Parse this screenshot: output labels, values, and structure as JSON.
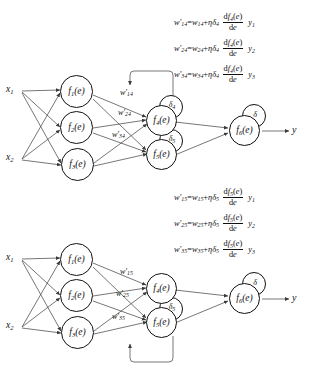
{
  "figure": {
    "type": "neural-network-backpropagation-diagram",
    "panels": [
      {
        "id": "top",
        "inputs": [
          {
            "name": "x1",
            "base": "x",
            "sub": "1"
          },
          {
            "name": "x2",
            "base": "x",
            "sub": "2"
          }
        ],
        "hidden_layer": [
          {
            "name": "f1",
            "base": "f",
            "sub": "1",
            "arg": "(e)"
          },
          {
            "name": "f2",
            "base": "f",
            "sub": "2",
            "arg": "(e)"
          },
          {
            "name": "f3",
            "base": "f",
            "sub": "3",
            "arg": "(e)"
          }
        ],
        "second_layer": [
          {
            "name": "f4",
            "base": "f",
            "sub": "4",
            "arg": "(e)",
            "delta": "4",
            "has_delta": true
          },
          {
            "name": "f5",
            "base": "f",
            "sub": "5",
            "arg": "(e)",
            "delta": "5",
            "has_delta": true
          }
        ],
        "output_layer": [
          {
            "name": "f6",
            "base": "f",
            "sub": "6",
            "arg": "(e)",
            "delta": "",
            "has_delta": true
          }
        ],
        "output_label": "y",
        "weight_labels": [
          {
            "base": "w",
            "prime": true,
            "sub": "14"
          },
          {
            "base": "w",
            "prime": true,
            "sub": "24"
          },
          {
            "base": "w",
            "prime": true,
            "sub": "34"
          }
        ],
        "formulas": [
          {
            "lhs_sub": "14",
            "rhs_sub": "14",
            "delta_sub": "4",
            "func_sub": "4",
            "y_sub": "1"
          },
          {
            "lhs_sub": "24",
            "rhs_sub": "24",
            "delta_sub": "4",
            "func_sub": "4",
            "y_sub": "2"
          },
          {
            "lhs_sub": "34",
            "rhs_sub": "34",
            "delta_sub": "4",
            "func_sub": "4",
            "y_sub": "3"
          }
        ],
        "feedback_loop": "from-f4-delta-back-to-hidden-layer-weights"
      },
      {
        "id": "bottom",
        "inputs": [
          {
            "name": "x1",
            "base": "x",
            "sub": "1"
          },
          {
            "name": "x2",
            "base": "x",
            "sub": "2"
          }
        ],
        "hidden_layer": [
          {
            "name": "f1",
            "base": "f",
            "sub": "1",
            "arg": "(e)"
          },
          {
            "name": "f2",
            "base": "f",
            "sub": "2",
            "arg": "(e)"
          },
          {
            "name": "f3",
            "base": "f",
            "sub": "3",
            "arg": "(e)"
          }
        ],
        "second_layer": [
          {
            "name": "f4",
            "base": "f",
            "sub": "4",
            "arg": "(e)",
            "delta": "",
            "has_delta": false
          },
          {
            "name": "f5",
            "base": "f",
            "sub": "5",
            "arg": "(e)",
            "delta": "5",
            "has_delta": true
          }
        ],
        "output_layer": [
          {
            "name": "f6",
            "base": "f",
            "sub": "6",
            "arg": "(e)",
            "delta": "",
            "has_delta": true
          }
        ],
        "output_label": "y",
        "weight_labels": [
          {
            "base": "w",
            "prime": true,
            "sub": "15"
          },
          {
            "base": "w",
            "prime": true,
            "sub": "25"
          },
          {
            "base": "w",
            "prime": true,
            "sub": "35"
          }
        ],
        "formulas": [
          {
            "lhs_sub": "15",
            "rhs_sub": "15",
            "delta_sub": "5",
            "func_sub": "5",
            "y_sub": "1"
          },
          {
            "lhs_sub": "25",
            "rhs_sub": "25",
            "delta_sub": "5",
            "func_sub": "5",
            "y_sub": "2"
          },
          {
            "lhs_sub": "35",
            "rhs_sub": "35",
            "delta_sub": "5",
            "func_sub": "5",
            "y_sub": "3"
          }
        ],
        "feedback_loop": "from-f5-delta-back-to-hidden-layer-weights"
      }
    ],
    "symbols": {
      "eta": "η",
      "delta": "δ",
      "d": "d",
      "e": "e",
      "equals": "=",
      "plus": "+",
      "prime": "'",
      "func_arg": "(e)",
      "derivative_den": "de"
    },
    "colors": {
      "stroke": "#111111",
      "background": "#ffffff",
      "text": "#111111"
    }
  }
}
